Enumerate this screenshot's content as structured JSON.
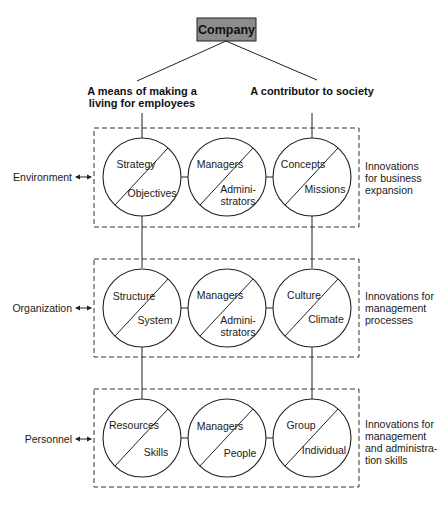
{
  "root": {
    "label": "Company",
    "fill": "#8c8c8c"
  },
  "branches": {
    "left": {
      "line1": "A means of making a",
      "line2": "living for employees"
    },
    "right": {
      "line1": "A contributor to society"
    }
  },
  "rows": [
    {
      "left_label": "Environment",
      "right_label": [
        "Innovations",
        "for business",
        "expansion"
      ],
      "circles": [
        {
          "top": "Strategy",
          "bottom": [
            "Objectives"
          ]
        },
        {
          "top": "Managers",
          "bottom": [
            "Admini-",
            "strators"
          ]
        },
        {
          "top": "Concepts",
          "bottom": [
            "Missions"
          ]
        }
      ]
    },
    {
      "left_label": "Organization",
      "right_label": [
        "Innovations for",
        "management",
        "processes"
      ],
      "circles": [
        {
          "top": "Structure",
          "bottom": [
            "System"
          ]
        },
        {
          "top": "Managers",
          "bottom": [
            "Admini-",
            "strators"
          ]
        },
        {
          "top": "Culture",
          "bottom": [
            "Climate"
          ]
        }
      ]
    },
    {
      "left_label": "Personnel",
      "right_label": [
        "Innovations for",
        "management",
        "and administra-",
        "tion skills"
      ],
      "circles": [
        {
          "top": "Resources",
          "bottom": [
            "Skills"
          ]
        },
        {
          "top": "Managers",
          "bottom": [
            "People"
          ]
        },
        {
          "top": "Group",
          "bottom": [
            "Individual"
          ]
        }
      ]
    }
  ],
  "icons": {
    "arrow": "double-headed-arrow-icon"
  }
}
